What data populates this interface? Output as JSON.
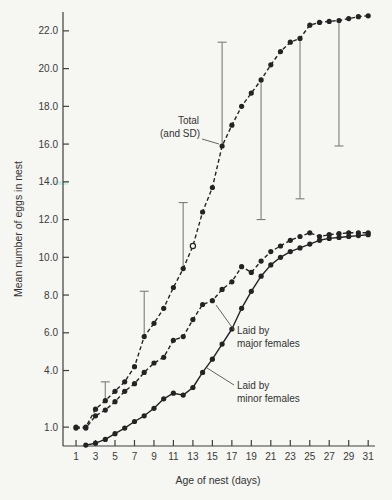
{
  "figure": {
    "paper_color": "#f6f6f2",
    "ink_color": "#232323",
    "annotations": {
      "total": {
        "line1": "Total",
        "line2": "(and SD)"
      },
      "major": {
        "line1": "Laid by",
        "line2": "major females"
      },
      "minor": {
        "line1": "Laid by",
        "line2": "minor females"
      }
    }
  },
  "chart_data": {
    "type": "line",
    "title": "",
    "xlabel": "Age of nest (days)",
    "ylabel": "Mean number of eggs in nest",
    "grid": false,
    "legend_position": "inline-annotations",
    "xlim": [
      -0.34,
      31.7
    ],
    "ylim": [
      0,
      23
    ],
    "x": [
      1,
      2,
      3,
      4,
      5,
      6,
      7,
      8,
      9,
      10,
      11,
      12,
      13,
      14,
      15,
      16,
      17,
      18,
      19,
      20,
      21,
      22,
      23,
      24,
      25,
      26,
      27,
      28,
      29,
      30,
      31
    ],
    "x_ticks": [
      1,
      3,
      5,
      7,
      9,
      11,
      13,
      15,
      17,
      19,
      21,
      23,
      25,
      27,
      29,
      31
    ],
    "x_tick_labels": [
      "1",
      "3",
      "5",
      "7",
      "9",
      "11",
      "13",
      "15",
      "17",
      "19",
      "21",
      "23",
      "25",
      "27",
      "29",
      "31"
    ],
    "y_ticks": [
      1,
      4,
      6,
      8,
      10,
      12,
      14,
      16,
      18,
      20,
      22
    ],
    "y_tick_labels": [
      "1.0",
      "4.0",
      "6.0",
      "8.0",
      "10.0",
      "12.0",
      "14.0",
      "16.0",
      "18.0",
      "20.0",
      "22.0"
    ],
    "series": [
      {
        "id": "total",
        "name": "Total (and SD)",
        "style": "dashed",
        "open_marker_days": [
          13
        ],
        "values": [
          1.0,
          1.0,
          1.95,
          2.4,
          2.9,
          3.4,
          4.2,
          5.8,
          6.5,
          7.3,
          8.4,
          9.4,
          10.6,
          12.4,
          13.7,
          15.9,
          17.0,
          18.0,
          18.7,
          19.4,
          20.2,
          20.9,
          21.4,
          21.6,
          22.3,
          22.45,
          22.5,
          22.55,
          22.65,
          22.75,
          22.8
        ]
      },
      {
        "id": "major",
        "name": "Laid by major females",
        "style": "dashed",
        "values": [
          0.95,
          0.95,
          1.6,
          1.9,
          2.35,
          2.9,
          3.3,
          3.9,
          4.4,
          4.7,
          5.6,
          5.8,
          6.7,
          7.5,
          7.7,
          8.3,
          8.7,
          9.5,
          9.2,
          9.8,
          10.3,
          10.6,
          10.9,
          11.1,
          11.3,
          11.1,
          11.2,
          11.25,
          11.3,
          11.3,
          11.3
        ]
      },
      {
        "id": "minor",
        "name": "Laid by minor females",
        "style": "solid",
        "values": [
          null,
          0.05,
          0.15,
          0.35,
          0.65,
          0.95,
          1.3,
          1.6,
          2.0,
          2.5,
          2.8,
          2.7,
          3.1,
          3.9,
          4.6,
          5.4,
          6.2,
          7.3,
          8.2,
          9.0,
          9.6,
          10.0,
          10.3,
          10.5,
          10.7,
          10.9,
          11.0,
          11.05,
          11.1,
          11.15,
          11.2
        ]
      }
    ],
    "error_bars": [
      {
        "day": 4,
        "from": 2.4,
        "to": 3.4,
        "cap": "top"
      },
      {
        "day": 8,
        "from": 5.8,
        "to": 8.2,
        "cap": "top"
      },
      {
        "day": 12,
        "from": 9.4,
        "to": 12.9,
        "cap": "top"
      },
      {
        "day": 16,
        "from": 15.9,
        "to": 21.4,
        "cap": "top"
      },
      {
        "day": 20,
        "from": 19.4,
        "to": 12.0,
        "cap": "bottom"
      },
      {
        "day": 24,
        "from": 21.6,
        "to": 13.1,
        "cap": "bottom"
      },
      {
        "day": 28,
        "from": 22.55,
        "to": 15.9,
        "cap": "bottom"
      }
    ]
  }
}
